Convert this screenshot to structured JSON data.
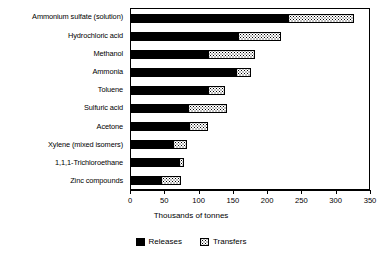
{
  "chart_data": {
    "type": "bar",
    "orientation": "horizontal",
    "stacked": true,
    "title": "",
    "xlabel": "Thousands of tonnes",
    "ylabel": "",
    "xlim": [
      0,
      350
    ],
    "xticks": [
      0,
      50,
      100,
      150,
      200,
      250,
      300,
      350
    ],
    "grid": false,
    "legend_position": "bottom-center",
    "categories": [
      "Ammonium sulfate (solution)",
      "Hydrochloric acid",
      "Methanol",
      "Ammonia",
      "Toluene",
      "Sulfuric acid",
      "Acetone",
      "Xylene (mixed isomers)",
      "1,1,1-Trichloroethane",
      "Zinc compounds"
    ],
    "series": [
      {
        "name": "Releases",
        "color": "#000000",
        "values": [
          230,
          157,
          113,
          154,
          113,
          84,
          85,
          62,
          71,
          44
        ]
      },
      {
        "name": "Transfers",
        "color": "#ffffff",
        "values": [
          95,
          62,
          68,
          21,
          24,
          56,
          28,
          19,
          7,
          29
        ]
      }
    ],
    "totals": [
      325,
      219,
      181,
      175,
      137,
      140,
      113,
      81,
      78,
      73
    ]
  },
  "axis": {
    "tick_labels": [
      "0",
      "50",
      "100",
      "150",
      "200",
      "250",
      "300",
      "350"
    ],
    "x_title": "Thousands of tonnes"
  },
  "legend": {
    "items": [
      {
        "label": "Releases",
        "swatch": "solid-black-swatch"
      },
      {
        "label": "Transfers",
        "swatch": "stippled-white-swatch"
      }
    ]
  }
}
